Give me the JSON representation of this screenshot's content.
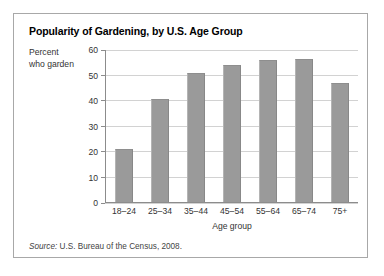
{
  "figure": {
    "title": "Popularity of Gardening, by U.S. Age Group",
    "source_label": "Source:",
    "source_text": " U.S. Bureau of the Census, 2008.",
    "border_color": "#a8a8a8"
  },
  "chart_data": {
    "type": "bar",
    "title": "Popularity of Gardening, by U.S. Age Group",
    "xlabel": "Age group",
    "ylabel": "Percent who garden",
    "ylabel_line1": "Percent",
    "ylabel_line2": "who garden",
    "categories": [
      "18–24",
      "25–34",
      "35–44",
      "45–54",
      "55–64",
      "65–74",
      "75+"
    ],
    "values": [
      21,
      40.5,
      51,
      54,
      56,
      56.5,
      47
    ],
    "ylim": [
      0,
      60
    ],
    "yticks": [
      60,
      50,
      40,
      30,
      20,
      10,
      0
    ],
    "ytick_labels": [
      "60",
      "50",
      "40",
      "30",
      "20",
      "10",
      "0"
    ],
    "grid": true,
    "grid_axis": "y",
    "legend": false,
    "bar_color": "#9a9a9a",
    "gridline_color": "#d2d2d2",
    "axis_color": "#8c8c8c"
  }
}
